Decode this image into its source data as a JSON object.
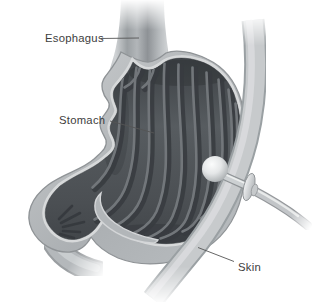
{
  "illustration": {
    "description": "Cross-section anatomical illustration of a stomach with a gastrostomy feeding tube button passing through the skin into the stomach",
    "labels": {
      "esophagus": "Esophagus",
      "stomach": "Stomach",
      "skin": "Skin"
    },
    "colors": {
      "background": "#ffffff",
      "label_text": "#3e3e3e",
      "leader_line": "#555555",
      "stomach_wall": "#b4b8bb",
      "stomach_interior": "#4d5155",
      "rugae_highlight": "#757a7e",
      "cut_rim": "#d6d8d9",
      "skin_band": "#c7cacc",
      "feeding_tube": "#c2c5c8",
      "balloon": "#eef0f0"
    }
  }
}
